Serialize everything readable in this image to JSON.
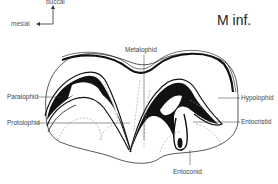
{
  "title": "M inf.",
  "orientation": {
    "up_label": "buccal",
    "left_label": "mesial"
  },
  "labels": {
    "metalophid": "Metalophid",
    "paralophid": "Paralophid",
    "protolophid": "Protolophid",
    "hypolophid": "Hypolophid",
    "entocristid": "Entocristid",
    "entoconid": "Entoconid"
  },
  "colors": {
    "line": "#111111",
    "fill": "#111111",
    "dashed": "#999999",
    "leader": "#333333"
  }
}
